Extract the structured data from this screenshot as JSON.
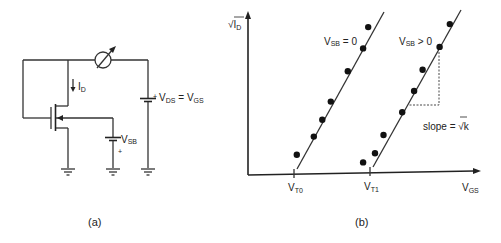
{
  "panel_a": {
    "caption": "(a)",
    "drain_current_label": {
      "main": "I",
      "sub": "D"
    },
    "vsb_label": {
      "main": "V",
      "sub": "SB"
    },
    "vsb_plus": "+",
    "vds_label": {
      "plus": "+",
      "v1": "V",
      "s1": "DS",
      "eq": " = ",
      "v2": "V",
      "s2": "GS"
    },
    "components": [
      "nmos-transistor",
      "ammeter",
      "vds-battery",
      "vsb-battery",
      "ground",
      "ground",
      "ground"
    ]
  },
  "panel_b": {
    "caption": "(b)",
    "y_axis_label": {
      "sqrt": "√",
      "main": "I",
      "sub": "D"
    },
    "x_axis_label": {
      "main": "V",
      "sub": "GS"
    },
    "ticks": [
      {
        "main": "V",
        "sub": "T0"
      },
      {
        "main": "V",
        "sub": "T1"
      }
    ],
    "curve_labels": [
      {
        "main": "V",
        "sub": "SB",
        "rest": " = 0"
      },
      {
        "main": "V",
        "sub": "SB",
        "rest": " > 0"
      }
    ],
    "slope_label": {
      "text": "slope = ",
      "sqrt": "√",
      "k": "k"
    }
  },
  "chart_data": {
    "type": "scatter",
    "title": "",
    "xlabel": "VGS",
    "ylabel": "√ID",
    "x_ticks": [
      "VT0",
      "VT1"
    ],
    "grid": false,
    "series": [
      {
        "name": "VSB = 0",
        "fit_line": "linear, x-intercept at VT0",
        "points": [
          [
            0.04,
            0.1
          ],
          [
            0.14,
            0.22
          ],
          [
            0.19,
            0.33
          ],
          [
            0.24,
            0.45
          ],
          [
            0.34,
            0.65
          ],
          [
            0.43,
            0.8
          ],
          [
            0.46,
            0.94
          ]
        ]
      },
      {
        "name": "VSB > 0",
        "fit_line": "linear, x-intercept at VT1, slope = √k",
        "points": [
          [
            0.43,
            0.05
          ],
          [
            0.5,
            0.11
          ],
          [
            0.55,
            0.23
          ],
          [
            0.66,
            0.38
          ],
          [
            0.73,
            0.52
          ],
          [
            0.78,
            0.66
          ],
          [
            0.88,
            0.81
          ],
          [
            0.94,
            0.96
          ]
        ]
      }
    ],
    "annotations": [
      "slope = √k"
    ],
    "xlim": [
      0,
      1
    ],
    "ylim": [
      0,
      1
    ]
  }
}
